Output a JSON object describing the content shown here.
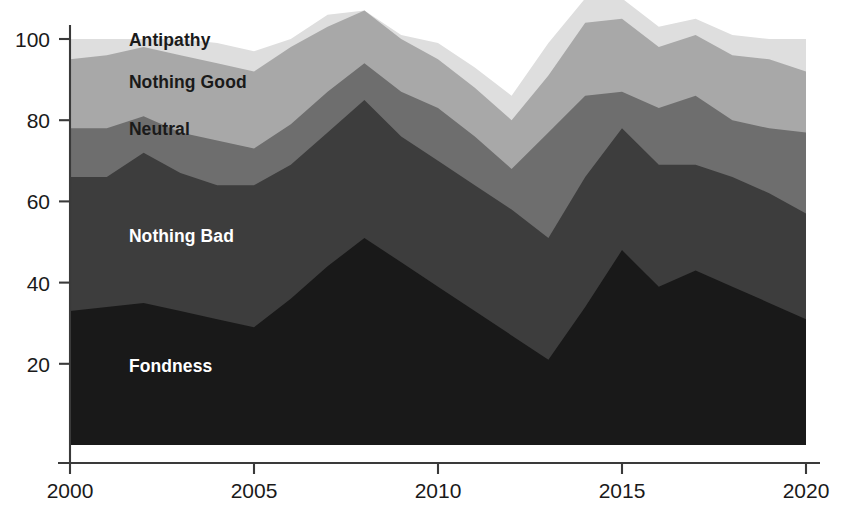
{
  "chart_data": {
    "type": "area",
    "stacked": true,
    "title": "",
    "subtitle": "",
    "xlabel": "",
    "ylabel": "",
    "xlim": [
      2000,
      2020
    ],
    "ylim": [
      0,
      100
    ],
    "grid": false,
    "legend_position": "inline-labels",
    "x": [
      2000,
      2001,
      2002,
      2003,
      2004,
      2005,
      2006,
      2007,
      2008,
      2009,
      2010,
      2011,
      2012,
      2013,
      2014,
      2015,
      2016,
      2017,
      2018,
      2019,
      2020
    ],
    "y_ticks": [
      20,
      40,
      60,
      80,
      100
    ],
    "x_ticks": [
      2000,
      2005,
      2010,
      2015,
      2020
    ],
    "x_tick_labels": [
      "2000",
      "2005",
      "2010",
      "2015",
      "2020"
    ],
    "y_tick_labels": [
      "20",
      "40",
      "60",
      "80",
      "100"
    ],
    "series": [
      {
        "name": "Fondness",
        "color": "#191919",
        "label_color": "#ffffff",
        "values": [
          33,
          34,
          35,
          33,
          31,
          29,
          36,
          44,
          51,
          45,
          39,
          33,
          27,
          21,
          34,
          48,
          39,
          43,
          39,
          35,
          31
        ]
      },
      {
        "name": "Nothing Bad",
        "color": "#3d3d3d",
        "label_color": "#ffffff",
        "values": [
          33,
          32,
          37,
          34,
          33,
          35,
          33,
          33,
          34,
          31,
          31,
          31,
          31,
          30,
          32,
          30,
          30,
          26,
          27,
          27,
          26
        ]
      },
      {
        "name": "Neutral",
        "color": "#6e6e6e",
        "label_color": "#1a1a1a",
        "values": [
          12,
          12,
          9,
          10,
          11,
          9,
          10,
          10,
          9,
          11,
          13,
          12,
          10,
          26,
          20,
          9,
          14,
          17,
          14,
          16,
          20
        ]
      },
      {
        "name": "Nothing Good",
        "color": "#a8a8a8",
        "label_color": "#1a1a1a",
        "values": [
          17,
          18,
          17,
          19,
          19,
          19,
          19,
          16,
          13,
          13,
          12,
          12,
          12,
          14,
          18,
          18,
          15,
          15,
          16,
          17,
          15
        ]
      },
      {
        "name": "Antipathy",
        "color": "#dedede",
        "label_color": "#1a1a1a",
        "values": [
          5,
          4,
          2,
          4,
          5,
          5,
          2,
          3,
          0,
          1,
          4,
          5,
          6,
          8,
          6,
          5,
          5,
          4,
          5,
          5,
          8
        ]
      }
    ],
    "series_labels": [
      {
        "name": "Antipathy",
        "x": 2001.6,
        "y": 98.2
      },
      {
        "name": "Nothing Good",
        "x": 2001.6,
        "y": 88.0
      },
      {
        "name": "Neutral",
        "x": 2001.6,
        "y": 76.3
      },
      {
        "name": "Nothing Bad",
        "x": 2001.6,
        "y": 50.0
      },
      {
        "name": "Fondness",
        "x": 2001.6,
        "y": 18.0
      }
    ]
  }
}
